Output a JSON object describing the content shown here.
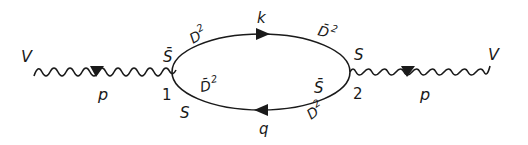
{
  "diagram": {
    "type": "feynman-diagram",
    "external_lines": [
      {
        "id": "left",
        "field_label": "V",
        "momentum_label": "p",
        "style": "wavy",
        "arrow": "right"
      },
      {
        "id": "right",
        "field_label": "V",
        "momentum_label": "p",
        "style": "wavy",
        "arrow": "right"
      }
    ],
    "vertices": [
      {
        "id": "1",
        "label": "1"
      },
      {
        "id": "2",
        "label": "2"
      }
    ],
    "internal_lines": [
      {
        "id": "top",
        "momentum_label": "k",
        "arrow": "right",
        "end_labels": {
          "vertex1": "S̄",
          "near1": "D²",
          "near2": "D̄²",
          "vertex2": "S"
        }
      },
      {
        "id": "bottom",
        "momentum_label": "q",
        "arrow": "left",
        "end_labels": {
          "vertex1": "S",
          "near1": "D̄²",
          "near2": "D²",
          "vertex2": "S̄"
        }
      }
    ]
  },
  "labels": {
    "v_left": "V",
    "v_right": "V",
    "p_left": "p",
    "p_right": "p",
    "vertex1": "1",
    "vertex2": "2",
    "k": "k",
    "q": "q",
    "sbar_1": "S̄",
    "s_1": "S",
    "d2_top_left": "D",
    "d2_top_left_sup": "2",
    "dbar2_top_right": "D̄",
    "dbar2_top_right_sup": "2",
    "s_2": "S",
    "sbar_2": "S̄",
    "dbar2_bottom_left": "D̄",
    "dbar2_bottom_left_sup": "2",
    "d2_bottom_right": "D",
    "d2_bottom_right_sup": "2"
  },
  "colors": {
    "ink": "#1a1a1a",
    "background": "#ffffff"
  }
}
